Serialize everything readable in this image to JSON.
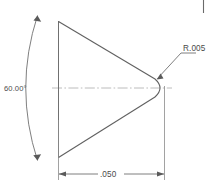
{
  "drawing": {
    "title": "Conical tip detail view",
    "background_color": "#ffffff",
    "line_color": "#555555",
    "centerline_color": "#b0b0b0",
    "text_color": "#4a4a4a",
    "annotations": {
      "angle_dimension": "60.00°",
      "length_dimension": ".050",
      "radius_callout": "R.005"
    },
    "elements": {
      "angle_arc_name": "angle-dimension-arc",
      "length_dim_name": "length-dimension-line",
      "radius_leader_name": "radius-leader-line",
      "centerline_name": "axis-centerline",
      "cone_upper_edge_name": "cone-upper-edge",
      "cone_lower_edge_name": "cone-lower-edge",
      "base_line_name": "cone-base-line",
      "tip_radius_name": "cone-tip-radius"
    }
  }
}
